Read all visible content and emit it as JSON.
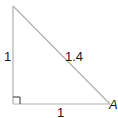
{
  "diagram": {
    "type": "right-triangle",
    "labels": {
      "left_side": "1",
      "hypotenuse": "1.4",
      "bottom_side": "1",
      "vertex": "A"
    },
    "colors": {
      "line": "#b0b0b0",
      "right_angle_marker": "#333333",
      "text": "#1a1a1a"
    }
  }
}
